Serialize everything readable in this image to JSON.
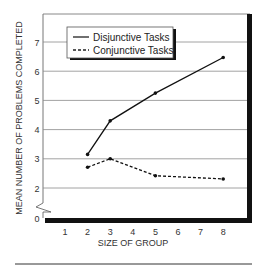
{
  "chart_data": {
    "type": "line",
    "title": "",
    "xlabel": "SIZE OF GROUP",
    "ylabel": "MEAN NUMBER OF PROBLEMS COMPLETED",
    "x_ticks": [
      "1",
      "2",
      "3",
      "4",
      "5",
      "6",
      "7",
      "8"
    ],
    "y_ticks": [
      "0",
      "2",
      "3",
      "4",
      "5",
      "6",
      "7"
    ],
    "ylim": [
      0,
      7.8
    ],
    "xlim": [
      0,
      9
    ],
    "y_axis_break": true,
    "grid": "horizontal",
    "legend_position": "upper-left",
    "x": [
      2,
      3,
      5,
      8
    ],
    "series": [
      {
        "name": "Disjunctive Tasks",
        "style": "solid",
        "values": [
          3.15,
          4.3,
          5.25,
          6.47
        ]
      },
      {
        "name": "Conjunctive Tasks",
        "style": "dashed",
        "values": [
          2.71,
          3.0,
          2.42,
          2.31
        ]
      }
    ]
  },
  "legend": {
    "items": [
      "Disjunctive Tasks",
      "Conjunctive Tasks"
    ]
  }
}
